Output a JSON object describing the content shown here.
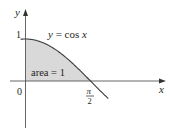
{
  "diagram": {
    "type": "function-plot",
    "function_label": "y = cos x",
    "function_label_parts": {
      "y": "y",
      "eq": " = cos ",
      "x": "x"
    },
    "shaded_region_label": "area = 1",
    "axes": {
      "x_label": "x",
      "y_label": "y",
      "origin_label": "0",
      "y_tick_label": "1",
      "x_tick_label_num": "π",
      "x_tick_label_den": "2"
    },
    "colors": {
      "curve": "#3a3a3a",
      "axis": "#555555",
      "shade": "#d9d9d9",
      "text": "#231f20"
    }
  }
}
